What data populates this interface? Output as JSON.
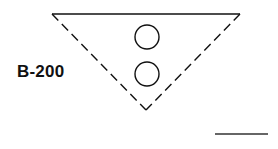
{
  "diagram": {
    "label": "B-200",
    "colors": {
      "stroke": "#111111",
      "background": "#ffffff"
    },
    "triangle": {
      "top_left": [
        52,
        14
      ],
      "top_right": [
        240,
        14
      ],
      "bottom": [
        146,
        110
      ],
      "top_edge_style": "solid",
      "side_edges_style": "dashed"
    },
    "circles": [
      {
        "cx": 147,
        "cy": 37,
        "r": 12
      },
      {
        "cx": 147,
        "cy": 74,
        "r": 12
      }
    ],
    "scale_bar": {
      "x1": 215,
      "x2": 268,
      "y": 134
    }
  }
}
